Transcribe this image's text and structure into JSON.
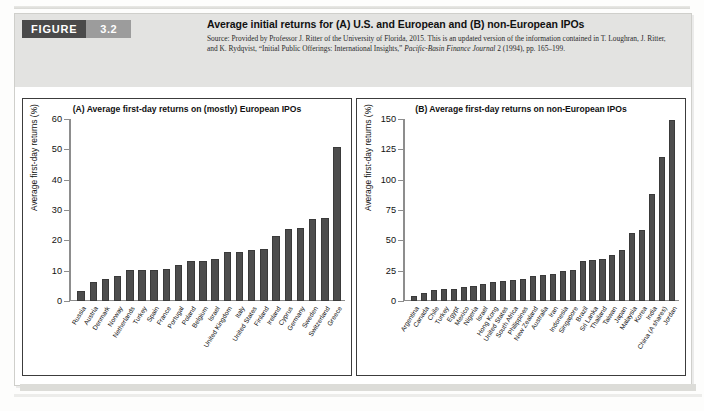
{
  "figure": {
    "badge_label": "FIGURE",
    "badge_number": "3.2",
    "title": "Average initial returns for (A) U.S. and European and (B) non-European IPOs",
    "source_line1": "Source: Provided by Professor J. Ritter of the University of Florida, 2015. This is an updated version of the information",
    "source_line2_pre": "contained in T. Loughran, J. Ritter, and K. Rydqvist, “Initial Public Offerings: International Insights,” ",
    "source_line2_ital": "Pacific-Basin Finance",
    "source_line3_ital": "Journal",
    "source_line3_post": " 2 (1994), pp. 165–199.",
    "badge_dark_color": "#4a4a4a",
    "badge_light_color": "#9c9c9c",
    "header_band_color": "#e3e3e1",
    "bar_color": "#4d4d4d"
  },
  "chart_data": [
    {
      "type": "bar",
      "panel": "A",
      "title": "(A) Average first-day returns on (mostly) European IPOs",
      "xlabel": "",
      "ylabel": "Average first-day returns (%)",
      "ylim": [
        0,
        60
      ],
      "yticks": [
        0,
        10,
        20,
        30,
        40,
        50,
        60
      ],
      "grid": false,
      "legend": "none",
      "categories": [
        "Russia",
        "Austria",
        "Denmark",
        "Norway",
        "Netherlands",
        "Turkey",
        "Spain",
        "France",
        "Portugal",
        "Poland",
        "Belgium",
        "Israel",
        "United Kingdom",
        "Italy",
        "United States",
        "Finland",
        "Ireland",
        "Cyprus",
        "Germany",
        "Sweden",
        "Switzerland",
        "Greece"
      ],
      "values": [
        3.3,
        6.3,
        7.4,
        8.1,
        10.2,
        10.2,
        10.3,
        10.6,
        11.9,
        13.1,
        13.3,
        13.8,
        16.0,
        16.3,
        16.8,
        17.2,
        21.5,
        23.7,
        24.1,
        27.1,
        27.3,
        50.8
      ]
    },
    {
      "type": "bar",
      "panel": "B",
      "title": "(B) Average first-day returns on non-European IPOs",
      "xlabel": "",
      "ylabel": "Average first-day returns (%)",
      "ylim": [
        0,
        150
      ],
      "yticks": [
        0,
        25,
        50,
        75,
        100,
        125,
        150
      ],
      "grid": false,
      "legend": "none",
      "categories": [
        "Argentina",
        "Canada",
        "Chile",
        "Turkey",
        "Egypt",
        "Mexico",
        "Nigeria",
        "Israel",
        "Hong Kong",
        "United States",
        "South Africa",
        "Philippines",
        "New Zealand",
        "Australia",
        "Iran",
        "Indonesia",
        "Singapore",
        "Brazil",
        "Sri Lanka",
        "Thailand",
        "Taiwan",
        "Japan",
        "Malaysia",
        "Korea",
        "India",
        "China (A shares)",
        "Jordan"
      ],
      "values": [
        4.4,
        6.5,
        8.8,
        9.6,
        10.0,
        11.6,
        12.7,
        13.8,
        15.8,
        16.9,
        17.4,
        18.1,
        20.3,
        21.8,
        22.4,
        24.9,
        25.8,
        33.1,
        33.5,
        35.0,
        38.1,
        41.7,
        56.2,
        58.8,
        88.0,
        118.4,
        149.0
      ]
    }
  ]
}
